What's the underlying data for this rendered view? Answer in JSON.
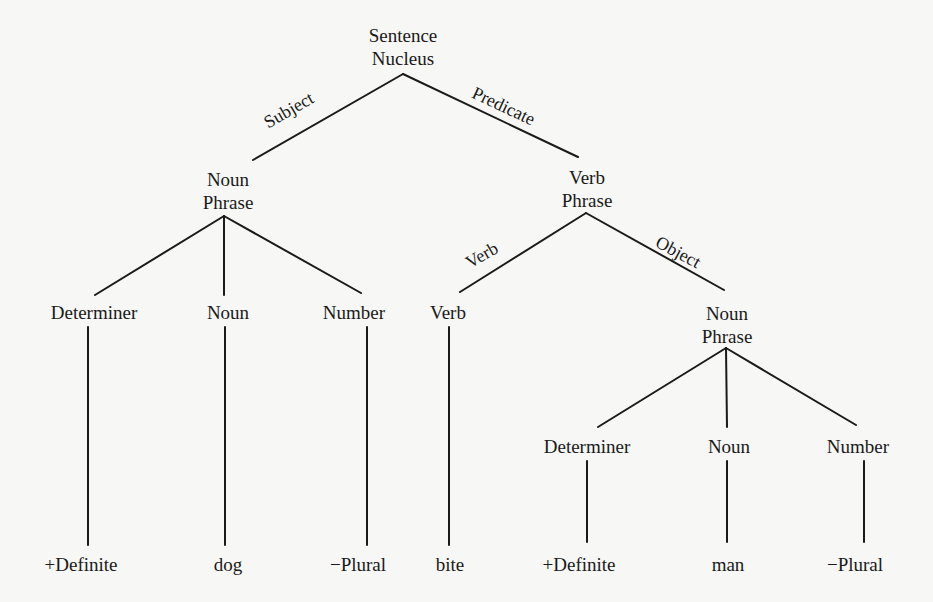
{
  "diagram": {
    "type": "syntax-tree",
    "root": {
      "line1": "Sentence",
      "line2": "Nucleus"
    },
    "edges": {
      "subject": "Subject",
      "predicate": "Predicate",
      "verb": "Verb",
      "object": "Object"
    },
    "subject_np": {
      "line1": "Noun",
      "line2": "Phrase"
    },
    "verb_phrase": {
      "line1": "Verb",
      "line2": "Phrase"
    },
    "object_np": {
      "line1": "Noun",
      "line2": "Phrase"
    },
    "left_constituents": [
      "Determiner",
      "Noun",
      "Number"
    ],
    "verb_constituent": "Verb",
    "right_constituents": [
      "Determiner",
      "Noun",
      "Number"
    ],
    "left_leaves": [
      "+Definite",
      "dog",
      "−Plural"
    ],
    "verb_leaf": "bite",
    "right_leaves": [
      "+Definite",
      "man",
      "−Plural"
    ]
  }
}
